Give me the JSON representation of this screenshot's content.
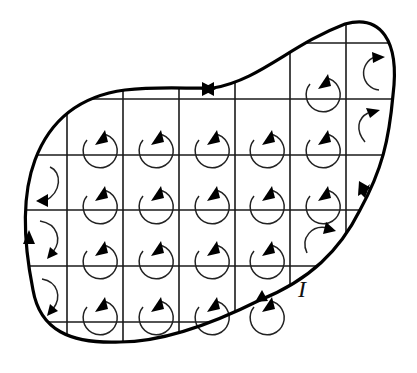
{
  "figure": {
    "boundary_label": "I",
    "boundary_direction": "clockwise",
    "colors": {
      "line": "#000000",
      "background": "#ffffff"
    },
    "grid": {
      "x_lines": [
        67,
        123,
        179,
        235,
        290,
        346
      ],
      "y_lines": [
        43,
        99,
        155,
        210,
        266,
        322
      ],
      "rows": 5,
      "cols": 6
    },
    "loops": {
      "full": [
        [
          5,
          0
        ],
        [
          6,
          0
        ],
        [
          1,
          1
        ],
        [
          2,
          1
        ],
        [
          3,
          1
        ],
        [
          4,
          1
        ],
        [
          5,
          1
        ],
        [
          1,
          2
        ],
        [
          2,
          2
        ],
        [
          3,
          2
        ],
        [
          4,
          2
        ],
        [
          5,
          2
        ],
        [
          1,
          3
        ],
        [
          2,
          3
        ],
        [
          3,
          3
        ],
        [
          4,
          3
        ],
        [
          1,
          4
        ],
        [
          2,
          4
        ],
        [
          3,
          4
        ],
        [
          4,
          4
        ]
      ],
      "partial": [
        {
          "cell": [
            6,
            0
          ],
          "kind": "arc-up-right"
        },
        {
          "cell": [
            6,
            1
          ],
          "kind": "arc-small-up-right"
        },
        {
          "cell": [
            0,
            2
          ],
          "kind": "arc-down-left"
        },
        {
          "cell": [
            0,
            3
          ],
          "kind": "arc-down"
        },
        {
          "cell": [
            0,
            4
          ],
          "kind": "arc-down"
        },
        {
          "cell": [
            5,
            4
          ],
          "kind": "arc-up-right"
        }
      ]
    }
  }
}
